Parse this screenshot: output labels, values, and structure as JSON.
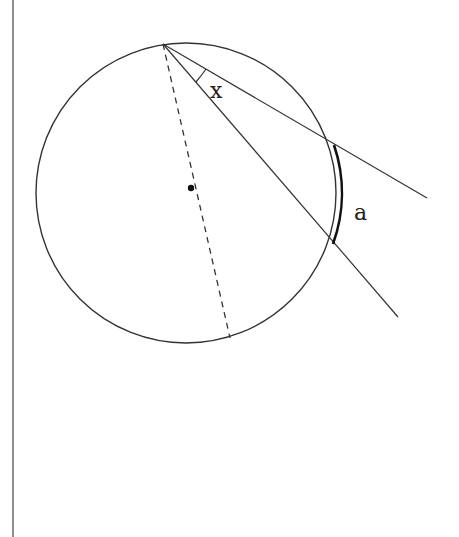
{
  "diagram": {
    "labels": {
      "angle": "x",
      "arc": "a"
    },
    "elements": {
      "circle": "circle",
      "center_point": "center",
      "diameter": "dashed diameter from vertex through center",
      "ray_upper": "ray from vertex",
      "ray_lower": "ray from vertex",
      "arc": "intercepted arc a (bold)"
    },
    "colors": {
      "stroke": "#333333",
      "background": "#ffffff"
    }
  }
}
